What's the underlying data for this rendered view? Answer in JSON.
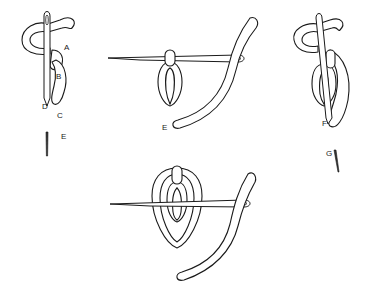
{
  "diagram": {
    "type": "embroidery-stitch-illustration",
    "panels": [
      {
        "id": "panel-1",
        "description": "Needle inserted vertically through loop with thread wrapped around",
        "labels": [
          "A",
          "B",
          "C",
          "D",
          "E"
        ]
      },
      {
        "id": "panel-2",
        "description": "Needle passing horizontally under stitch with thread through eye",
        "labels": [
          "E"
        ]
      },
      {
        "id": "panel-3",
        "description": "Needle inserted vertically through second loop with thread wrapped around",
        "labels": [
          "F",
          "G"
        ]
      },
      {
        "id": "panel-4",
        "description": "Needle passing horizontally under nested double loop with thread through eye",
        "labels": []
      }
    ],
    "labels": {
      "A": "A",
      "B": "B",
      "C": "C",
      "D": "D",
      "E1": "E",
      "E2": "E",
      "F": "F",
      "G": "G"
    },
    "colors": {
      "line": "#1a1a1a",
      "fill": "#ffffff"
    }
  }
}
